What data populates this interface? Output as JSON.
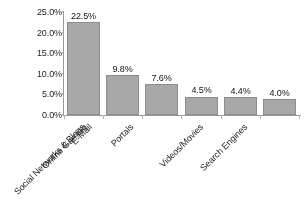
{
  "chart_data": {
    "type": "bar",
    "title": "",
    "subtitle": "",
    "xlabel": "",
    "ylabel": "",
    "ylim": [
      0,
      25
    ],
    "ytick_values": [
      0,
      5,
      10,
      15,
      20,
      25
    ],
    "ytick_labels": [
      "0.0%",
      "5.0%",
      "10.0%",
      "15.0%",
      "20.0%",
      "25.0%"
    ],
    "grid": false,
    "legend": false,
    "legend_position": "none",
    "categories": [
      "Social Networks & Blogs",
      "Online Gaming",
      "E-Mail",
      "Portals",
      "Videos/Movies",
      "Search Engines"
    ],
    "values": [
      22.5,
      9.8,
      7.6,
      4.5,
      4.4,
      4.0
    ],
    "value_labels": [
      "22.5%",
      "9.8%",
      "7.6%",
      "4.5%",
      "4.4%",
      "4.0%"
    ],
    "bar_color": "#a8a8a8",
    "bar_border_color": "#8c8c8c",
    "axis_color": "#9a9a9a",
    "text_color": "#1d1d1d",
    "background_color": "#ffffff"
  }
}
